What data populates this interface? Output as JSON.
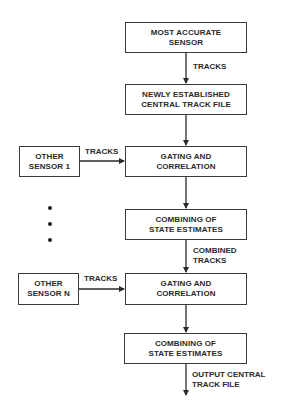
{
  "diagram": {
    "type": "flowchart",
    "main_column": [
      {
        "id": "most-accurate-sensor",
        "label": "MOST ACCURATE\nSENSOR"
      },
      {
        "id": "newly-established-track-file",
        "label": "NEWLY ESTABLISHED\nCENTRAL TRACK FILE"
      },
      {
        "id": "gating-correlation-1",
        "label": "GATING AND\nCORRELATION"
      },
      {
        "id": "combining-state-estimates-1",
        "label": "COMBINING OF\nSTATE ESTIMATES"
      },
      {
        "id": "gating-correlation-n",
        "label": "GATING AND\nCORRELATION"
      },
      {
        "id": "combining-state-estimates-n",
        "label": "COMBINING OF\nSTATE ESTIMATES"
      }
    ],
    "side_sensors": [
      {
        "id": "other-sensor-1",
        "label": "OTHER\nSENSOR 1"
      },
      {
        "id": "other-sensor-n",
        "label": "OTHER\nSENSOR N"
      }
    ],
    "edge_labels": {
      "tracks_top": "TRACKS",
      "tracks_sensor_1": "TRACKS",
      "combined_tracks": "COMBINED\nTRACKS",
      "tracks_sensor_n": "TRACKS",
      "output": "OUTPUT CENTRAL\nTRACK FILE"
    },
    "ellipsis_dots": 3,
    "colors": {
      "line": "#2a2a2a",
      "background": "#ffffff",
      "text": "#2a2a2a"
    }
  }
}
